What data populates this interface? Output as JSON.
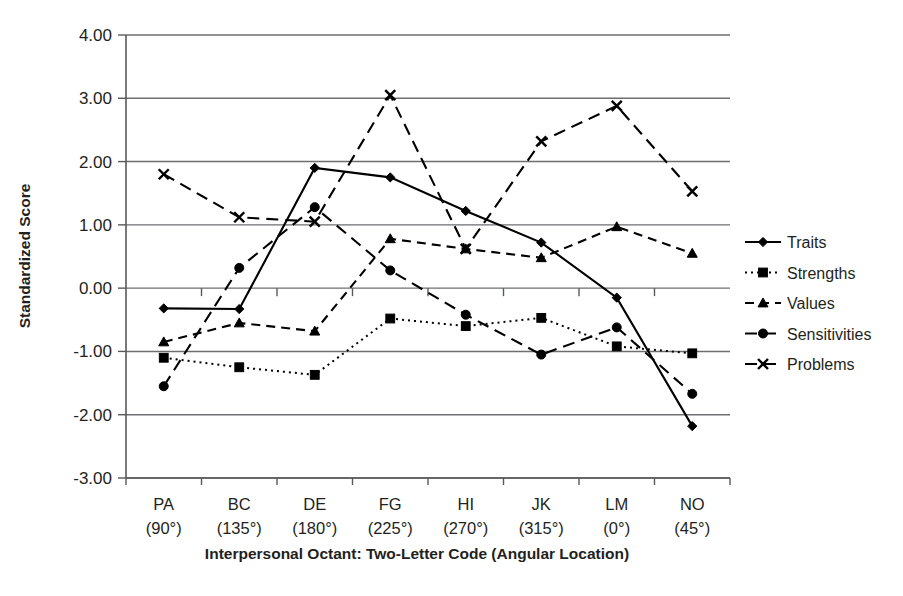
{
  "chart_data": {
    "type": "line",
    "title": "",
    "xlabel": "Interpersonal Octant: Two-Letter Code (Angular Location)",
    "ylabel": "Standardized Score",
    "categories": [
      "PA",
      "BC",
      "DE",
      "FG",
      "HI",
      "JK",
      "LM",
      "NO"
    ],
    "category_sublabels": [
      "(90°)",
      "(135°)",
      "(180°)",
      "(225°)",
      "(270°)",
      "(315°)",
      "(0°)",
      "(45°)"
    ],
    "ylim": [
      -3.0,
      4.0
    ],
    "ytick_labels": [
      "4.00",
      "3.00",
      "2.00",
      "1.00",
      "0.00",
      "-1.00",
      "-2.00",
      "-3.00"
    ],
    "ytick_values": [
      4.0,
      3.0,
      2.0,
      1.0,
      0.0,
      -1.0,
      -2.0,
      -3.0
    ],
    "grid": true,
    "grid_axis": "y",
    "legend_position": "right",
    "series": [
      {
        "name": "Traits",
        "marker": "diamond",
        "line_style": "solid",
        "values": [
          -0.32,
          -0.33,
          1.9,
          1.75,
          1.22,
          0.72,
          -0.15,
          -2.18
        ]
      },
      {
        "name": "Strengths",
        "marker": "square",
        "line_style": "dotted",
        "values": [
          -1.1,
          -1.25,
          -1.37,
          -0.48,
          -0.6,
          -0.47,
          -0.92,
          -1.03
        ]
      },
      {
        "name": "Values",
        "marker": "triangle",
        "line_style": "dashed",
        "values": [
          -0.85,
          -0.55,
          -0.68,
          0.78,
          0.62,
          0.48,
          0.97,
          0.55
        ]
      },
      {
        "name": "Sensitivities",
        "marker": "circle",
        "line_style": "dashed-long",
        "values": [
          -1.55,
          0.32,
          1.28,
          0.28,
          -0.42,
          -1.05,
          -0.62,
          -1.67
        ]
      },
      {
        "name": "Problems",
        "marker": "x",
        "line_style": "dashed-long",
        "values": [
          1.8,
          1.12,
          1.05,
          3.05,
          0.62,
          2.32,
          2.88,
          1.53
        ]
      }
    ]
  },
  "colors": {
    "ink": "#231f20",
    "grid": "#6d6e70",
    "axis": "#58595b",
    "background": "#ffffff"
  },
  "legend": {
    "items": [
      {
        "label": "Traits"
      },
      {
        "label": "Strengths"
      },
      {
        "label": "Values"
      },
      {
        "label": "Sensitivities"
      },
      {
        "label": "Problems"
      }
    ]
  }
}
